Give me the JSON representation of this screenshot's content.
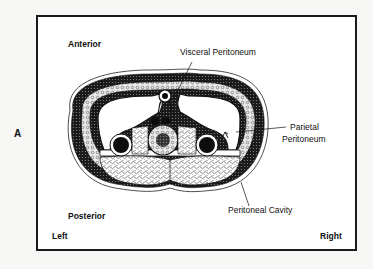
{
  "figure": {
    "panel_label": "A",
    "orientation": {
      "anterior": "Anterior",
      "posterior": "Posterior",
      "left": "Left",
      "right": "Right"
    },
    "annotations": {
      "visceral_peritoneum": "Visceral Peritoneum",
      "parietal_peritoneum_line1": "Parietal",
      "parietal_peritoneum_line2": "Peritoneum",
      "peritoneal_cavity": "Peritoneal Cavity"
    },
    "colors": {
      "ink": "#111111",
      "background": "#ffffff",
      "page": "#f7f7f5"
    }
  }
}
